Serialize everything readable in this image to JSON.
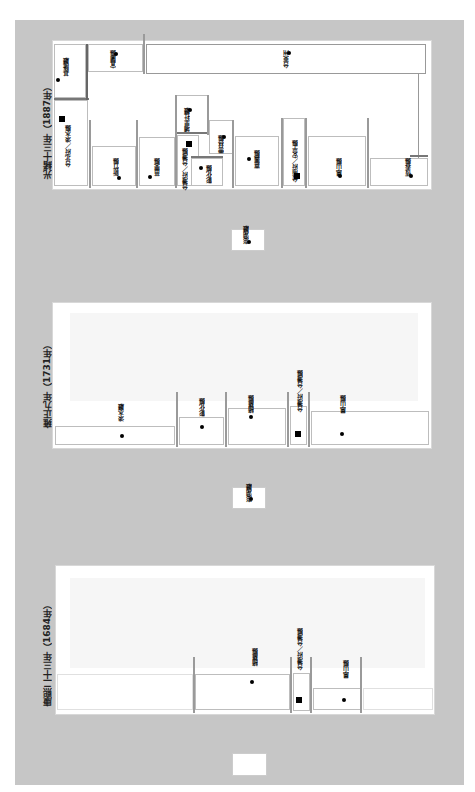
{
  "panels": {
    "p1887": {
      "title": "光緒十三年（1887年）",
      "divisions": [
        {
          "name": "基隆廳"
        },
        {
          "name": "宜蘭縣"
        },
        {
          "name": "台北府／淡水縣",
          "capital": true
        },
        {
          "name": "新竹縣"
        },
        {
          "name": "苗栗縣"
        },
        {
          "name": "埔里社廳"
        },
        {
          "name": "台灣府／台灣縣",
          "capital": true
        },
        {
          "name": "彰化縣"
        },
        {
          "name": "雲林縣"
        },
        {
          "name": "嘉義縣"
        },
        {
          "name": "台南府／安平縣",
          "capital": true
        },
        {
          "name": "鳳山縣"
        },
        {
          "name": "恆春縣"
        },
        {
          "name": "台東州"
        }
      ],
      "offshore": {
        "name": "澎湖廳"
      }
    },
    "p1731": {
      "title": "雍正九年（1731年）",
      "divisions": [
        {
          "name": "淡水廳"
        },
        {
          "name": "彰化縣"
        },
        {
          "name": "諸羅縣"
        },
        {
          "name": "台灣府／台灣縣",
          "capital": true
        },
        {
          "name": "鳳山縣"
        }
      ],
      "offshore": {
        "name": "澎湖廳"
      }
    },
    "p1684": {
      "title": "康熙二十三年（1684年）",
      "divisions": [
        {
          "name": "諸羅縣"
        },
        {
          "name": "台灣府／台灣縣",
          "capital": true
        },
        {
          "name": "鳳山縣"
        }
      ],
      "offshore": {
        "name": ""
      }
    }
  },
  "colors": {
    "background": "#c6c6c6",
    "panel": "#ffffff",
    "border": "#9a9a9a",
    "marker": "#000000"
  }
}
